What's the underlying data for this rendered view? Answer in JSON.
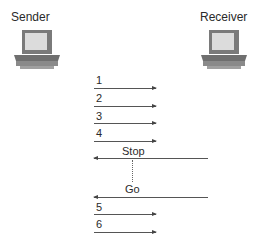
{
  "nodes": {
    "sender": {
      "label": "Sender",
      "icon": "computer-icon"
    },
    "receiver": {
      "label": "Receiver",
      "icon": "computer-icon"
    }
  },
  "messages": [
    {
      "label": "1",
      "direction": "right"
    },
    {
      "label": "2",
      "direction": "right"
    },
    {
      "label": "3",
      "direction": "right"
    },
    {
      "label": "4",
      "direction": "right"
    },
    {
      "label": "Stop",
      "direction": "left"
    },
    {
      "label": "Go",
      "direction": "left"
    },
    {
      "label": "5",
      "direction": "right"
    },
    {
      "label": "6",
      "direction": "right"
    }
  ],
  "colors": {
    "line": "#555555",
    "monitor_screen": "#d9d9d9",
    "monitor_body": "#8c8c8c"
  }
}
